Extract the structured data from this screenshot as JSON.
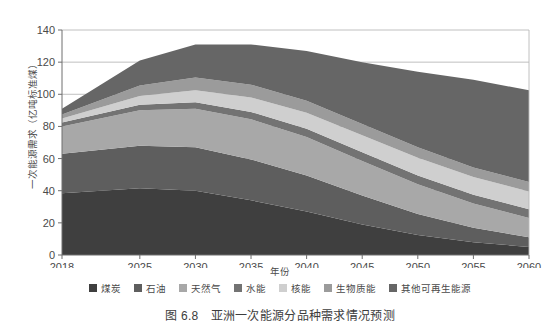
{
  "caption": {
    "number": "图 6.8",
    "text": "亚洲一次能源分品种需求情况预测"
  },
  "axis": {
    "ylabel": "一次能源需求（亿吨标准煤）",
    "xlabel": "年份"
  },
  "colors": {
    "coal": "#3f3f3f",
    "oil": "#5e5e5e",
    "gas": "#a8a8a8",
    "hydro": "#737373",
    "nuclear": "#cfcfcf",
    "biomass": "#9b9b9b",
    "other_renewables": "#666666",
    "axis_line": "#6e6e6e",
    "grid_line": "#b9b9b9",
    "tick_text": "#4a4a4a",
    "plot_background": "#ffffff"
  },
  "chart_data": {
    "type": "area",
    "stacked": true,
    "title": "亚洲一次能源分品种需求情况预测",
    "xlabel": "年份",
    "ylabel": "一次能源需求（亿吨标准煤）",
    "grid": "horizontal",
    "legend_position": "bottom",
    "xlim": [
      2018,
      2060
    ],
    "ylim": [
      0,
      140
    ],
    "yticks": [
      0,
      20,
      40,
      60,
      80,
      100,
      120,
      140
    ],
    "xticks": [
      2018,
      2025,
      2030,
      2035,
      2040,
      2045,
      2050,
      2055,
      2060
    ],
    "x": [
      2018,
      2025,
      2030,
      2035,
      2040,
      2045,
      2050,
      2055,
      2060
    ],
    "series": [
      {
        "name": "煤炭",
        "key": "coal",
        "values": [
          38.5,
          41.5,
          40.0,
          34.0,
          27.0,
          19.0,
          12.5,
          8.0,
          5.0
        ]
      },
      {
        "name": "石油",
        "key": "oil",
        "values": [
          24.5,
          26.5,
          27.0,
          25.5,
          22.5,
          18.0,
          13.0,
          9.0,
          6.0
        ]
      },
      {
        "name": "天然气",
        "key": "gas",
        "values": [
          17.0,
          22.0,
          24.0,
          25.0,
          24.0,
          21.5,
          18.5,
          15.0,
          12.0
        ]
      },
      {
        "name": "水能",
        "key": "hydro",
        "values": [
          2.5,
          3.5,
          4.0,
          4.5,
          5.0,
          5.5,
          5.5,
          5.5,
          5.5
        ]
      },
      {
        "name": "核能",
        "key": "nuclear",
        "values": [
          2.5,
          5.5,
          7.5,
          9.0,
          10.0,
          10.5,
          11.0,
          11.0,
          11.0
        ]
      },
      {
        "name": "生物质能",
        "key": "biomass",
        "values": [
          2.5,
          6.5,
          8.0,
          8.0,
          7.5,
          7.0,
          6.5,
          6.0,
          6.0
        ]
      },
      {
        "name": "其他可再生能源",
        "key": "other_renewables",
        "values": [
          3.5,
          15.5,
          20.5,
          25.0,
          31.0,
          38.5,
          47.0,
          54.5,
          57.0
        ]
      }
    ],
    "totals": [
      91.0,
      121.0,
      131.0,
      131.0,
      127.0,
      120.0,
      114.0,
      109.0,
      102.5
    ]
  },
  "legend": [
    {
      "label": "煤炭",
      "color_key": "coal"
    },
    {
      "label": "石油",
      "color_key": "oil"
    },
    {
      "label": "天然气",
      "color_key": "gas"
    },
    {
      "label": "水能",
      "color_key": "hydro"
    },
    {
      "label": "核能",
      "color_key": "nuclear"
    },
    {
      "label": "生物质能",
      "color_key": "biomass"
    },
    {
      "label": "其他可再生能源",
      "color_key": "other_renewables"
    }
  ]
}
